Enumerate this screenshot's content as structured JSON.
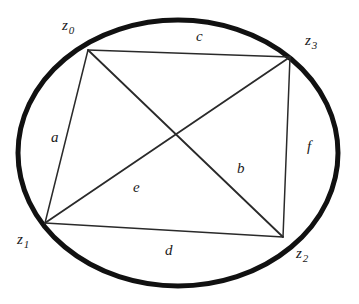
{
  "figure": {
    "colors": {
      "ink": "#1a1a1a",
      "ellipse_stroke": "#111111",
      "chord_stroke": "#2a2a2a",
      "background": "#ffffff"
    },
    "ellipse": {
      "cx": 178,
      "cy": 153,
      "rx": 160,
      "ry": 133,
      "stroke_width": 5
    },
    "vertices": [
      {
        "id": "z0",
        "base": "z",
        "subscript": "0",
        "x": 88,
        "y": 50,
        "label_x": 62,
        "label_y": 18
      },
      {
        "id": "z3",
        "base": "z",
        "subscript": "3",
        "x": 290,
        "y": 57,
        "label_x": 305,
        "label_y": 33
      },
      {
        "id": "z1",
        "base": "z",
        "subscript": "1",
        "x": 45,
        "y": 223,
        "label_x": 17,
        "label_y": 232
      },
      {
        "id": "z2",
        "base": "z",
        "subscript": "2",
        "x": 283,
        "y": 237,
        "label_x": 296,
        "label_y": 246
      }
    ],
    "chords": [
      {
        "id": "a",
        "label": "a",
        "from": "z0",
        "to": "z1",
        "kind": "side",
        "x1": 88,
        "y1": 50,
        "x2": 45,
        "y2": 223,
        "label_x": 51,
        "label_y": 130
      },
      {
        "id": "c",
        "label": "c",
        "from": "z0",
        "to": "z3",
        "kind": "side",
        "x1": 88,
        "y1": 50,
        "x2": 290,
        "y2": 57,
        "label_x": 196,
        "label_y": 29
      },
      {
        "id": "f",
        "label": "f",
        "from": "z3",
        "to": "z2",
        "kind": "side",
        "x1": 290,
        "y1": 57,
        "x2": 283,
        "y2": 237,
        "label_x": 307,
        "label_y": 139
      },
      {
        "id": "d",
        "label": "d",
        "from": "z1",
        "to": "z2",
        "kind": "side",
        "x1": 45,
        "y1": 223,
        "x2": 283,
        "y2": 237,
        "label_x": 165,
        "label_y": 243
      },
      {
        "id": "e",
        "label": "e",
        "from": "z1",
        "to": "z3",
        "kind": "diagonal",
        "x1": 45,
        "y1": 223,
        "x2": 290,
        "y2": 57,
        "label_x": 133,
        "label_y": 180
      },
      {
        "id": "b",
        "label": "b",
        "from": "z0",
        "to": "z2",
        "kind": "diagonal",
        "x1": 88,
        "y1": 50,
        "x2": 283,
        "y2": 237,
        "label_x": 237,
        "label_y": 161
      }
    ]
  }
}
